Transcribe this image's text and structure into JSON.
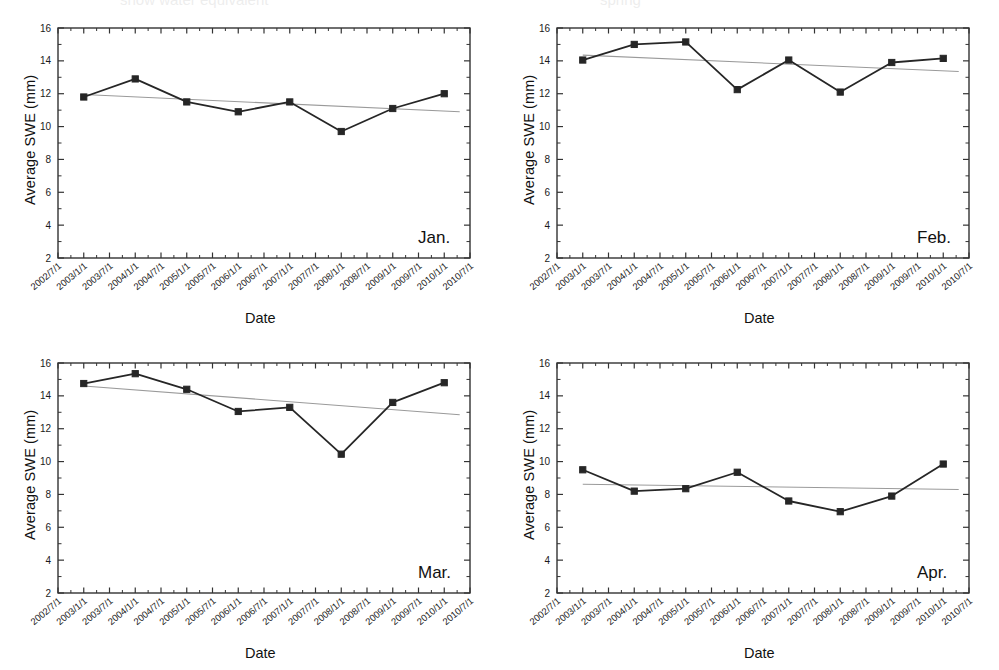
{
  "figure": {
    "panel_count": 4,
    "y_axis_title": "Average SWE (mm)",
    "x_axis_title": "Date",
    "series_color": "#262626",
    "trend_color": "#9a9a9a",
    "axis_color": "#333333",
    "background": "#ffffff"
  },
  "axis": {
    "y_ticks": [
      "2",
      "4",
      "6",
      "8",
      "10",
      "12",
      "14",
      "16"
    ],
    "x_ticks": [
      "2002/7/1",
      "2003/1/1",
      "2003/7/1",
      "2004/1/1",
      "2004/7/1",
      "2005/1/1",
      "2005/7/1",
      "2006/1/1",
      "2006/7/1",
      "2007/1/1",
      "2007/7/1",
      "2008/1/1",
      "2008/7/1",
      "2009/1/1",
      "2009/7/1",
      "2010/1/1",
      "2010/7/1"
    ]
  },
  "chart_data": [
    {
      "type": "line",
      "title": "Jan.",
      "xlabel": "Date",
      "ylabel": "Average SWE (mm)",
      "ylim": [
        2,
        16
      ],
      "ytick_step": 2,
      "grid": false,
      "legend": "none",
      "x": [
        "2003/1/1",
        "2004/1/1",
        "2005/1/1",
        "2006/1/1",
        "2007/1/1",
        "2008/1/1",
        "2009/1/1",
        "2010/1/1"
      ],
      "xtick_labels": [
        "2002/7/1",
        "2003/1/1",
        "2003/7/1",
        "2004/1/1",
        "2004/7/1",
        "2005/1/1",
        "2005/7/1",
        "2006/1/1",
        "2006/7/1",
        "2007/1/1",
        "2007/7/1",
        "2008/1/1",
        "2008/7/1",
        "2009/1/1",
        "2009/7/1",
        "2010/1/1",
        "2010/7/1"
      ],
      "series": [
        {
          "name": "Average SWE",
          "values": [
            11.8,
            12.9,
            11.5,
            10.9,
            11.5,
            9.7,
            11.1,
            12.0
          ]
        }
      ],
      "trendline": {
        "name": "Linear fit",
        "y_start": 11.95,
        "y_end": 10.9
      }
    },
    {
      "type": "line",
      "title": "Feb.",
      "xlabel": "Date",
      "ylabel": "Average SWE (mm)",
      "ylim": [
        2,
        16
      ],
      "ytick_step": 2,
      "grid": false,
      "legend": "none",
      "x": [
        "2003/1/1",
        "2004/1/1",
        "2005/1/1",
        "2006/1/1",
        "2007/1/1",
        "2008/1/1",
        "2009/1/1",
        "2010/1/1"
      ],
      "xtick_labels": [
        "2002/7/1",
        "2003/1/1",
        "2003/7/1",
        "2004/1/1",
        "2004/7/1",
        "2005/1/1",
        "2005/7/1",
        "2006/1/1",
        "2006/7/1",
        "2007/1/1",
        "2007/7/1",
        "2008/1/1",
        "2008/7/1",
        "2009/1/1",
        "2009/7/1",
        "2010/1/1",
        "2010/7/1"
      ],
      "series": [
        {
          "name": "Average SWE",
          "values": [
            14.05,
            15.0,
            15.15,
            12.25,
            14.05,
            12.1,
            13.9,
            14.15
          ]
        }
      ],
      "trendline": {
        "name": "Linear fit",
        "y_start": 14.35,
        "y_end": 13.35
      }
    },
    {
      "type": "line",
      "title": "Mar.",
      "xlabel": "Date",
      "ylabel": "Average SWE (mm)",
      "ylim": [
        2,
        16
      ],
      "ytick_step": 2,
      "grid": false,
      "legend": "none",
      "x": [
        "2003/1/1",
        "2004/1/1",
        "2005/1/1",
        "2006/1/1",
        "2007/1/1",
        "2008/1/1",
        "2009/1/1",
        "2010/1/1"
      ],
      "xtick_labels": [
        "2002/7/1",
        "2003/1/1",
        "2003/7/1",
        "2004/1/1",
        "2004/7/1",
        "2005/1/1",
        "2005/7/1",
        "2006/1/1",
        "2006/7/1",
        "2007/1/1",
        "2007/7/1",
        "2008/1/1",
        "2008/7/1",
        "2009/1/1",
        "2009/7/1",
        "2010/1/1",
        "2010/7/1"
      ],
      "series": [
        {
          "name": "Average SWE",
          "values": [
            14.75,
            15.35,
            14.4,
            13.05,
            13.3,
            10.45,
            13.6,
            14.8
          ]
        }
      ],
      "trendline": {
        "name": "Linear fit",
        "y_start": 14.6,
        "y_end": 12.85
      }
    },
    {
      "type": "line",
      "title": "Apr.",
      "xlabel": "Date",
      "ylabel": "Average SWE (mm)",
      "ylim": [
        2,
        16
      ],
      "ytick_step": 2,
      "grid": false,
      "legend": "none",
      "x": [
        "2003/1/1",
        "2004/1/1",
        "2005/1/1",
        "2006/1/1",
        "2007/1/1",
        "2008/1/1",
        "2009/1/1",
        "2010/1/1"
      ],
      "xtick_labels": [
        "2002/7/1",
        "2003/1/1",
        "2003/7/1",
        "2004/1/1",
        "2004/7/1",
        "2005/1/1",
        "2005/7/1",
        "2006/1/1",
        "2006/7/1",
        "2007/1/1",
        "2007/7/1",
        "2008/1/1",
        "2008/7/1",
        "2009/1/1",
        "2009/7/1",
        "2010/1/1",
        "2010/7/1"
      ],
      "series": [
        {
          "name": "Average SWE",
          "values": [
            9.5,
            8.2,
            8.35,
            9.35,
            7.6,
            6.95,
            7.9,
            9.85
          ]
        }
      ],
      "trendline": {
        "name": "Linear fit",
        "y_start": 8.62,
        "y_end": 8.3
      }
    }
  ]
}
